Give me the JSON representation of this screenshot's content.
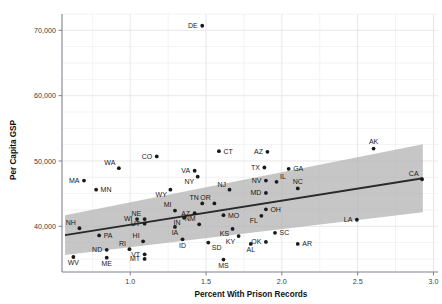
{
  "chart_data": {
    "type": "scatter",
    "title": "",
    "xlabel": "Percent With Prison Records",
    "ylabel": "Per Capita GSP",
    "xlim": [
      0.55,
      3.03
    ],
    "ylim": [
      33000,
      72500
    ],
    "xticks": [
      "1.0",
      "1.5",
      "2.0",
      "2.5",
      "3.0"
    ],
    "xtick_values": [
      1.0,
      1.5,
      2.0,
      2.5,
      3.0
    ],
    "yticks": [
      "40,000",
      "50,000",
      "60,000",
      "70,000"
    ],
    "ytick_values": [
      40000,
      50000,
      60000,
      70000
    ],
    "grid": "both-minor",
    "legend": "none",
    "point_label_field": "state",
    "fit": {
      "type": "linear-regression-with-confidence-band",
      "line_color": "#2a2a2a",
      "band_color": "#b0b0b0",
      "x_start": 0.57,
      "x_end": 2.93,
      "y_start": 38650,
      "y_end": 47350,
      "band_lower_start": 35600,
      "band_upper_start": 41700,
      "band_lower_end": 42150,
      "band_upper_end": 52550
    },
    "points": [
      {
        "state": "DE",
        "x": 1.475,
        "y": 70700,
        "label_pos": "left"
      },
      {
        "state": "AK",
        "x": 2.605,
        "y": 51900,
        "label_pos": "above"
      },
      {
        "state": "CT",
        "x": 1.585,
        "y": 51500,
        "label_pos": "right"
      },
      {
        "state": "AZ",
        "x": 1.905,
        "y": 51400,
        "label_pos": "left"
      },
      {
        "state": "CO",
        "x": 1.175,
        "y": 50700,
        "label_pos": "left"
      },
      {
        "state": "WA",
        "x": 0.925,
        "y": 48900,
        "label_pos": "above-left"
      },
      {
        "state": "TX",
        "x": 1.885,
        "y": 49000,
        "label_pos": "left"
      },
      {
        "state": "VA",
        "x": 1.425,
        "y": 48500,
        "label_pos": "left"
      },
      {
        "state": "GA",
        "x": 2.045,
        "y": 48800,
        "label_pos": "right"
      },
      {
        "state": "NY",
        "x": 1.445,
        "y": 47600,
        "label_pos": "below-left"
      },
      {
        "state": "MA",
        "x": 0.695,
        "y": 47000,
        "label_pos": "left"
      },
      {
        "state": "CA",
        "x": 2.925,
        "y": 47200,
        "label_pos": "above-left"
      },
      {
        "state": "IL",
        "x": 1.965,
        "y": 46800,
        "label_pos": "above-right"
      },
      {
        "state": "NV",
        "x": 1.895,
        "y": 47000,
        "label_pos": "left"
      },
      {
        "state": "NC",
        "x": 2.105,
        "y": 45800,
        "label_pos": "above"
      },
      {
        "state": "MN",
        "x": 0.775,
        "y": 45600,
        "label_pos": "right"
      },
      {
        "state": "NJ",
        "x": 1.655,
        "y": 45600,
        "label_pos": "above-left"
      },
      {
        "state": "WY",
        "x": 1.265,
        "y": 45600,
        "label_pos": "below-left"
      },
      {
        "state": "MD",
        "x": 1.895,
        "y": 45100,
        "label_pos": "left"
      },
      {
        "state": "TN",
        "x": 1.475,
        "y": 43500,
        "label_pos": "above-left"
      },
      {
        "state": "OR",
        "x": 1.555,
        "y": 43500,
        "label_pos": "above-left"
      },
      {
        "state": "MI",
        "x": 1.295,
        "y": 42400,
        "label_pos": "above-left"
      },
      {
        "state": "OH",
        "x": 1.895,
        "y": 42600,
        "label_pos": "right"
      },
      {
        "state": "AZ2",
        "state_label": "AZ",
        "x": 1.425,
        "y": 42000,
        "label_pos": "left"
      },
      {
        "state": "MO",
        "x": 1.615,
        "y": 41700,
        "label_pos": "right"
      },
      {
        "state": "NE",
        "x": 1.095,
        "y": 41100,
        "label_pos": "above-left"
      },
      {
        "state": "WI",
        "x": 1.045,
        "y": 41100,
        "label_pos": "left"
      },
      {
        "state": "FL",
        "x": 1.865,
        "y": 41600,
        "label_pos": "below-left"
      },
      {
        "state": "IN",
        "x": 1.355,
        "y": 41300,
        "label_pos": "below-left"
      },
      {
        "state": "LA",
        "x": 2.495,
        "y": 41000,
        "label_pos": "left"
      },
      {
        "state": "NM",
        "x": 1.455,
        "y": 40300,
        "label_pos": "above-left"
      },
      {
        "state": "UT",
        "x": 1.095,
        "y": 40400,
        "label_pos": "left"
      },
      {
        "state": "NH",
        "x": 0.665,
        "y": 39700,
        "label_pos": "above-left"
      },
      {
        "state": "IA",
        "x": 1.295,
        "y": 39900,
        "label_pos": "below"
      },
      {
        "state": "KS",
        "x": 1.675,
        "y": 39600,
        "label_pos": "below-left"
      },
      {
        "state": "SC",
        "x": 1.955,
        "y": 39000,
        "label_pos": "right"
      },
      {
        "state": "PA",
        "x": 0.795,
        "y": 38600,
        "label_pos": "right"
      },
      {
        "state": "KY",
        "x": 1.715,
        "y": 38500,
        "label_pos": "below-left"
      },
      {
        "state": "OK",
        "x": 1.895,
        "y": 37600,
        "label_pos": "left"
      },
      {
        "state": "HI",
        "x": 1.085,
        "y": 37700,
        "label_pos": "above-left"
      },
      {
        "state": "SD",
        "x": 1.515,
        "y": 37500,
        "label_pos": "below-right"
      },
      {
        "state": "AR",
        "x": 2.105,
        "y": 37300,
        "label_pos": "right"
      },
      {
        "state": "ID",
        "x": 1.345,
        "y": 38000,
        "label_pos": "below"
      },
      {
        "state": "AL",
        "x": 1.795,
        "y": 37300,
        "label_pos": "below"
      },
      {
        "state": "RI",
        "x": 0.995,
        "y": 36500,
        "label_pos": "above-left"
      },
      {
        "state": "ND",
        "x": 0.845,
        "y": 36400,
        "label_pos": "left"
      },
      {
        "state": "VT",
        "x": 1.095,
        "y": 35700,
        "label_pos": "left"
      },
      {
        "state": "ME",
        "x": 0.845,
        "y": 35200,
        "label_pos": "below"
      },
      {
        "state": "MT",
        "x": 1.095,
        "y": 35000,
        "label_pos": "left"
      },
      {
        "state": "WV",
        "x": 0.625,
        "y": 35300,
        "label_pos": "below"
      },
      {
        "state": "MS",
        "x": 1.615,
        "y": 34900,
        "label_pos": "below"
      }
    ]
  },
  "axes": {
    "x_title": "Percent With Prison Records",
    "y_title": "Per Capita GSP"
  },
  "colors": {
    "point": "#1a1a1a",
    "line": "#2a2a2a",
    "band": "#b0b0b0",
    "grid": "#e4e4ec",
    "axis": "#808090",
    "text": "#1a1a1a",
    "background": "#ffffff"
  }
}
